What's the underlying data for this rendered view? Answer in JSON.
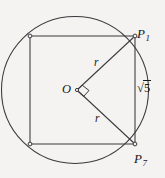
{
  "figure": {
    "kind": "geometry-diagram",
    "background_color": "#f4f3f1",
    "stroke_color": "#3a3a3e",
    "text_color": "#18171a",
    "canvas": {
      "width": 165,
      "height": 178
    },
    "circle": {
      "cx": 75,
      "cy": 90,
      "r": 73.5
    },
    "square": {
      "top_left": {
        "x": 30,
        "y": 36
      },
      "top_right": {
        "x": 135,
        "y": 36
      },
      "bottom_right": {
        "x": 135,
        "y": 144
      },
      "bottom_left": {
        "x": 30,
        "y": 144
      }
    },
    "center_point": {
      "x": 77,
      "y": 90
    },
    "radii": [
      {
        "name": "radius-upper",
        "from": {
          "x": 77,
          "y": 90
        },
        "to": {
          "x": 135,
          "y": 36
        }
      },
      {
        "name": "radius-lower",
        "from": {
          "x": 77,
          "y": 90
        },
        "to": {
          "x": 135,
          "y": 144
        }
      }
    ],
    "right_angle_marker": {
      "x": 88,
      "y": 90,
      "size": 9
    },
    "vertex_markers": [
      {
        "x": 30,
        "y": 36
      },
      {
        "x": 135,
        "y": 36
      },
      {
        "x": 135,
        "y": 144
      },
      {
        "x": 30,
        "y": 144
      }
    ],
    "labels": {
      "center": {
        "text": "O",
        "x": 62,
        "y": 83
      },
      "point_top": {
        "letter": "P",
        "subscript": "1",
        "x": 137,
        "y": 27
      },
      "point_bottom": {
        "letter": "P",
        "subscript": "7",
        "x": 134,
        "y": 152
      },
      "radius_upper": {
        "text": "r",
        "x": 94,
        "y": 57
      },
      "radius_lower": {
        "text": "r",
        "x": 95,
        "y": 113
      },
      "side_length": {
        "symbol": "√",
        "radicand": "5",
        "x": 137,
        "y": 82
      }
    }
  }
}
